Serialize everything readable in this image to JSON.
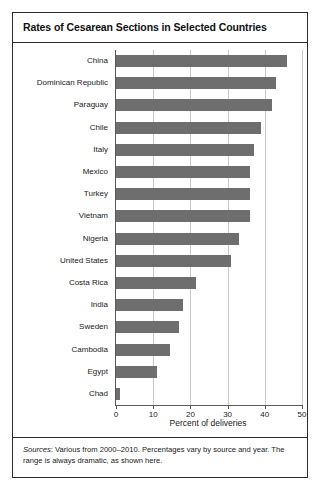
{
  "chart_data": {
    "type": "bar",
    "orientation": "horizontal",
    "title": "Rates of Cesarean Sections in Selected Countries",
    "xlabel": "Percent of deliveries",
    "ylabel": "",
    "xlim": [
      0,
      50
    ],
    "xticks": [
      0,
      10,
      20,
      30,
      40,
      50
    ],
    "grid": true,
    "legend": false,
    "bar_color": "#6e6e6e",
    "categories": [
      "China",
      "Dominican Republic",
      "Paraguay",
      "Chile",
      "Italy",
      "Mexico",
      "Turkey",
      "Vietnam",
      "Nigeria",
      "United States",
      "Costa Rica",
      "India",
      "Sweden",
      "Cambodia",
      "Egypt",
      "Chad"
    ],
    "values": [
      46,
      43,
      42,
      39,
      37,
      36,
      36,
      36,
      33,
      31,
      21.5,
      18,
      17,
      14.5,
      11,
      1
    ]
  },
  "source_note": {
    "label": "Sources",
    "text": ": Various from 2000–2010. Percentages vary by source and year. The range is always dramatic, as shown here."
  }
}
